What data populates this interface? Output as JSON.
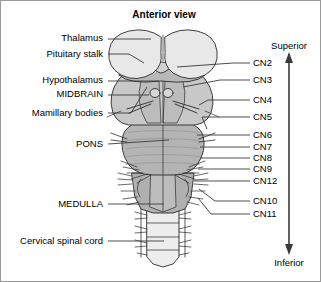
{
  "figure": {
    "title": "Anterior view",
    "background_color": "#ffffff",
    "border_color": "#9a9a9a"
  },
  "orientation_axis": {
    "top_label": "Superior",
    "bottom_label": "Inferior",
    "arrow_color": "#3a3a3a"
  },
  "palette": {
    "thalamus_fill": "#e8e8e8",
    "midbrain_fill": "#c8c8c8",
    "pons_fill": "#b4b4b4",
    "medulla_fill": "#b0b0b0",
    "cord_fill": "#ededed",
    "outline": "#2b2b2b",
    "leader_line": "#3a3a3a"
  },
  "left_labels": [
    {
      "id": "thalamus",
      "text": "Thalamus",
      "y": 37,
      "text_right_x": 104,
      "leader_to_x": 150,
      "leader_to_y": 38
    },
    {
      "id": "pituitary-stalk",
      "text": "Pituitary stalk",
      "y": 53,
      "text_right_x": 104,
      "leader_to_x": 143,
      "leader_to_y": 62
    },
    {
      "id": "hypothalamus",
      "text": "Hypothalamus",
      "y": 79,
      "text_right_x": 104,
      "leader_to_x": 158,
      "leader_to_y": 80
    },
    {
      "id": "midbrain",
      "text": "MIDBRAIN",
      "y": 93,
      "text_right_x": 104,
      "leader_to_x": 148,
      "leader_to_y": 94
    },
    {
      "id": "mamillary-bodies",
      "text": "Mamillary bodies",
      "y": 112,
      "text_right_x": 104,
      "leader_to_x": 146,
      "leader_to_y": 84
    },
    {
      "id": "pons",
      "text": "PONS",
      "y": 143,
      "text_right_x": 104,
      "leader_to_x": 168,
      "leader_to_y": 139
    },
    {
      "id": "medulla",
      "text": "MEDULLA",
      "y": 203,
      "text_right_x": 104,
      "leader_to_x": 163,
      "leader_to_y": 203
    },
    {
      "id": "cervical-spinal-cord",
      "text": "Cervical spinal cord",
      "y": 240,
      "text_right_x": 104,
      "leader_to_x": 163,
      "leader_to_y": 240
    }
  ],
  "cranial_nerve_labels": [
    {
      "id": "cn2",
      "text": "CN2",
      "y": 62,
      "text_left_x": 252,
      "leader_from_x": 232,
      "leader_from_y": 66
    },
    {
      "id": "cn3",
      "text": "CN3",
      "y": 79,
      "text_left_x": 252,
      "leader_from_x": 219,
      "leader_from_y": 86
    },
    {
      "id": "cn4",
      "text": "CN4",
      "y": 99,
      "text_left_x": 252,
      "leader_from_x": 207,
      "leader_from_y": 104
    },
    {
      "id": "cn5",
      "text": "CN5",
      "y": 116,
      "text_left_x": 252,
      "leader_from_x": 201,
      "leader_from_y": 126
    },
    {
      "id": "cn6",
      "text": "CN6",
      "y": 134,
      "text_left_x": 252,
      "leader_from_x": 196,
      "leader_from_y": 143
    },
    {
      "id": "cn7",
      "text": "CN7",
      "y": 146,
      "text_left_x": 252,
      "leader_from_x": 199,
      "leader_from_y": 152
    },
    {
      "id": "cn8",
      "text": "CN8",
      "y": 157,
      "text_left_x": 252,
      "leader_from_x": 199,
      "leader_from_y": 160
    },
    {
      "id": "cn9",
      "text": "CN9",
      "y": 168,
      "text_left_x": 252,
      "leader_from_x": 197,
      "leader_from_y": 172
    },
    {
      "id": "cn12",
      "text": "CN12",
      "y": 180,
      "text_left_x": 252,
      "leader_from_x": 193,
      "leader_from_y": 182
    },
    {
      "id": "cn10",
      "text": "CN10",
      "y": 200,
      "text_left_x": 252,
      "leader_from_x": 198,
      "leader_from_y": 190
    },
    {
      "id": "cn11",
      "text": "CN11",
      "y": 213,
      "text_left_x": 252,
      "leader_from_x": 200,
      "leader_from_y": 198
    }
  ],
  "anatomy_parts": [
    {
      "id": "thalamus-left",
      "name": "thalamus-left-lobe"
    },
    {
      "id": "thalamus-right",
      "name": "thalamus-right-lobe"
    },
    {
      "id": "optic-chiasm",
      "name": "optic-chiasm"
    },
    {
      "id": "pituitary-stalk",
      "name": "pituitary-stalk"
    },
    {
      "id": "midbrain",
      "name": "midbrain"
    },
    {
      "id": "mamillary-bodies",
      "name": "mamillary-bodies"
    },
    {
      "id": "pons",
      "name": "pons"
    },
    {
      "id": "medulla",
      "name": "medulla-oblongata"
    },
    {
      "id": "cervical-spinal-cord",
      "name": "cervical-spinal-cord"
    }
  ]
}
